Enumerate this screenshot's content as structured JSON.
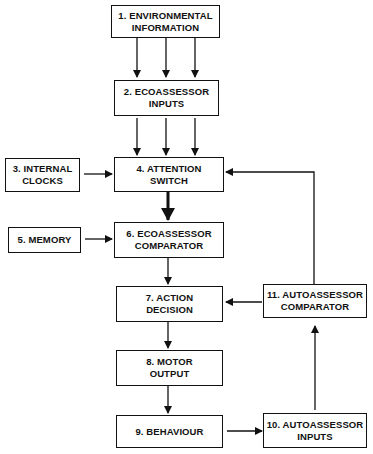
{
  "diagram": {
    "nodes": [
      {
        "id": "1",
        "label": "1. ENVIRONMENTAL\nINFORMATION"
      },
      {
        "id": "2",
        "label": "2. ECOASSESSOR\nINPUTS"
      },
      {
        "id": "3",
        "label": "3. INTERNAL\nCLOCKS"
      },
      {
        "id": "4",
        "label": "4. ATTENTION\nSWITCH"
      },
      {
        "id": "5",
        "label": "5. MEMORY"
      },
      {
        "id": "6",
        "label": "6. ECOASSESSOR\nCOMPARATOR"
      },
      {
        "id": "7",
        "label": "7. ACTION\nDECISION"
      },
      {
        "id": "8",
        "label": "8. MOTOR\nOUTPUT"
      },
      {
        "id": "9",
        "label": "9. BEHAVIOUR"
      },
      {
        "id": "10",
        "label": "10. AUTOASSESSOR\nINPUTS"
      },
      {
        "id": "11",
        "label": "11. AUTOASSESSOR\nCOMPARATOR"
      }
    ],
    "edges": [
      {
        "from": "1",
        "to": "2",
        "count": 3
      },
      {
        "from": "2",
        "to": "4",
        "count": 3
      },
      {
        "from": "3",
        "to": "4"
      },
      {
        "from": "4",
        "to": "6",
        "style": "bold"
      },
      {
        "from": "5",
        "to": "6"
      },
      {
        "from": "6",
        "to": "7"
      },
      {
        "from": "7",
        "to": "8"
      },
      {
        "from": "8",
        "to": "9"
      },
      {
        "from": "9",
        "to": "10"
      },
      {
        "from": "10",
        "to": "11"
      },
      {
        "from": "11",
        "to": "7"
      },
      {
        "from": "11",
        "to": "4"
      }
    ]
  }
}
